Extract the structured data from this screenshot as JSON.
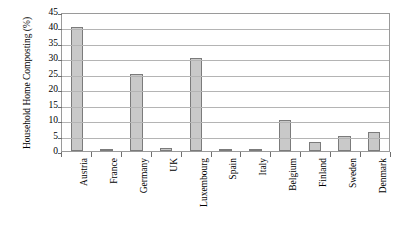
{
  "chart_data": {
    "type": "bar",
    "title": "",
    "xlabel": "",
    "ylabel": "Household Home Composting (%)",
    "categories": [
      "Austria",
      "France",
      "Germany",
      "UK",
      "Luxembourg",
      "Spain",
      "Italy",
      "Belgium",
      "Finland",
      "Sweden",
      "Denmark"
    ],
    "values": [
      40,
      0.5,
      25,
      1,
      30,
      0.5,
      0.5,
      10,
      3,
      5,
      6
    ],
    "ylim": [
      0,
      45
    ],
    "ytick_step": 5,
    "yticks": [
      45,
      40,
      35,
      30,
      25,
      20,
      15,
      10,
      5,
      0
    ],
    "ytick_labels": [
      "45",
      "40",
      "35",
      "30",
      "25",
      "20",
      "15",
      "10",
      "5",
      "0"
    ],
    "grid": true,
    "grid_axis": "y",
    "legend": false,
    "legend_position": "none",
    "bar_fill_color": "#c9c9c9",
    "bar_edge_color": "#7b7b7b",
    "gridline_color": "#b4b4b4",
    "plot_border_color": "#9a9a9a",
    "text_color": "#000000",
    "background_color": "#ffffff",
    "xtick_label_rotation": 90
  }
}
